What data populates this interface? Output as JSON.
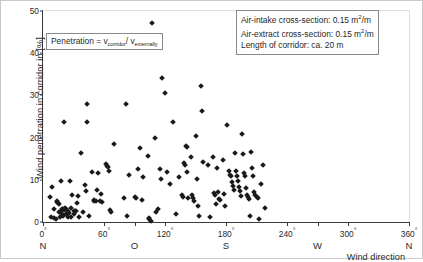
{
  "chart_data": {
    "type": "scatter",
    "title": "",
    "xlabel": "Wind direction",
    "ylabel": "Wind penetration in corridor in [%]",
    "xlim": [
      0,
      360
    ],
    "ylim": [
      0,
      50
    ],
    "grid": false,
    "legend": "none",
    "xticks": [
      {
        "value": 0,
        "label": "0",
        "degree": "°",
        "direction": "N"
      },
      {
        "value": 60,
        "label": "60",
        "degree": "°",
        "direction": ""
      },
      {
        "value": 90,
        "label": "",
        "degree": "",
        "direction": "O"
      },
      {
        "value": 120,
        "label": "120",
        "degree": "°",
        "direction": ""
      },
      {
        "value": 180,
        "label": "180",
        "degree": "°",
        "direction": "S"
      },
      {
        "value": 240,
        "label": "240",
        "degree": "°",
        "direction": ""
      },
      {
        "value": 270,
        "label": "",
        "degree": "",
        "direction": "W"
      },
      {
        "value": 300,
        "label": "300",
        "degree": "°",
        "direction": ""
      },
      {
        "value": 360,
        "label": "360",
        "degree": "°",
        "direction": "N"
      }
    ],
    "yticks": [
      0,
      10,
      20,
      30,
      40,
      50
    ],
    "marker": "diamond",
    "marker_color": "#1a1a1a",
    "points": [
      [
        6.5,
        6.0
      ],
      [
        8.0,
        1.2
      ],
      [
        9.0,
        8.2
      ],
      [
        10.5,
        1.0
      ],
      [
        11.0,
        3.0
      ],
      [
        12.5,
        0.8
      ],
      [
        13.5,
        4.8
      ],
      [
        14.0,
        5.0
      ],
      [
        14.5,
        4.5
      ],
      [
        15.5,
        2.3
      ],
      [
        16.0,
        4.3
      ],
      [
        16.5,
        1.3
      ],
      [
        17.5,
        2.6
      ],
      [
        18.0,
        9.7
      ],
      [
        18.5,
        3.0
      ],
      [
        19.0,
        2.0
      ],
      [
        19.5,
        3.1
      ],
      [
        20.0,
        1.5
      ],
      [
        20.5,
        2.8
      ],
      [
        21.0,
        23.7
      ],
      [
        22.0,
        3.4
      ],
      [
        22.5,
        2.0
      ],
      [
        23.0,
        3.0
      ],
      [
        23.5,
        1.8
      ],
      [
        24.5,
        2.5
      ],
      [
        25.0,
        1.1
      ],
      [
        26.0,
        2.2
      ],
      [
        26.5,
        9.7
      ],
      [
        27.5,
        3.2
      ],
      [
        28.0,
        1.2
      ],
      [
        29.0,
        6.3
      ],
      [
        30.0,
        2.5
      ],
      [
        30.5,
        1.8
      ],
      [
        31.5,
        2.6
      ],
      [
        32.0,
        2.5
      ],
      [
        33.0,
        4.5
      ],
      [
        34.0,
        6.2
      ],
      [
        35.0,
        1.2
      ],
      [
        37.0,
        16.3
      ],
      [
        39.0,
        2.4
      ],
      [
        41.0,
        8.8
      ],
      [
        42.0,
        7.3
      ],
      [
        43.0,
        28.0
      ],
      [
        43.5,
        23.7
      ],
      [
        45.0,
        1.4
      ],
      [
        48.0,
        11.9
      ],
      [
        50.0,
        5.2
      ],
      [
        50.5,
        5.0
      ],
      [
        52.0,
        4.9
      ],
      [
        53.0,
        7.5
      ],
      [
        54.0,
        11.7
      ],
      [
        56.0,
        5.0
      ],
      [
        57.0,
        6.7
      ],
      [
        58.0,
        4.8
      ],
      [
        62.0,
        13.8
      ],
      [
        63.0,
        13.3
      ],
      [
        64.0,
        13.0
      ],
      [
        64.5,
        12.2
      ],
      [
        66.0,
        2.9
      ],
      [
        66.5,
        2.4
      ],
      [
        70.0,
        18.5
      ],
      [
        80.0,
        5.6
      ],
      [
        82.0,
        28.0
      ],
      [
        83.0,
        1.5
      ],
      [
        85.0,
        11.2
      ],
      [
        90.0,
        6.0
      ],
      [
        91.0,
        5.8
      ],
      [
        93.0,
        12.6
      ],
      [
        95.0,
        17.5
      ],
      [
        97.0,
        5.3
      ],
      [
        98.0,
        10.7
      ],
      [
        103.0,
        15.7
      ],
      [
        104.0,
        0.9
      ],
      [
        104.5,
        0.6
      ],
      [
        106.0,
        0.2
      ],
      [
        107.0,
        47.2
      ],
      [
        110.0,
        20.0
      ],
      [
        111.0,
        2.4
      ],
      [
        113.0,
        3.0
      ],
      [
        115.0,
        12.5
      ],
      [
        116.0,
        10.2
      ],
      [
        117.0,
        34.1
      ],
      [
        120.0,
        30.5
      ],
      [
        122.0,
        11.9
      ],
      [
        125.0,
        8.9
      ],
      [
        128.0,
        23.7
      ],
      [
        131.0,
        1.8
      ],
      [
        134.0,
        10.7
      ],
      [
        137.0,
        6.5
      ],
      [
        138.0,
        6.0
      ],
      [
        139.0,
        14.0
      ],
      [
        140.0,
        13.5
      ],
      [
        141.0,
        18.0
      ],
      [
        141.5,
        17.8
      ],
      [
        142.0,
        11.9
      ],
      [
        143.0,
        5.8
      ],
      [
        146.0,
        15.3
      ],
      [
        147.0,
        6.3
      ],
      [
        148.0,
        5.8
      ],
      [
        149.0,
        4.9
      ],
      [
        150.0,
        20.3
      ],
      [
        151.0,
        10.2
      ],
      [
        152.0,
        3.7
      ],
      [
        153.0,
        1.4
      ],
      [
        155.0,
        32.2
      ],
      [
        156.0,
        26.4
      ],
      [
        157.0,
        14.1
      ],
      [
        162.0,
        13.6
      ],
      [
        164.0,
        1.1
      ],
      [
        167.0,
        15.4
      ],
      [
        168.0,
        6.9
      ],
      [
        169.0,
        6.5
      ],
      [
        170.0,
        4.3
      ],
      [
        171.0,
        12.9
      ],
      [
        172.0,
        7.0
      ],
      [
        173.0,
        5.5
      ],
      [
        174.0,
        5.2
      ],
      [
        177.0,
        14.6
      ],
      [
        178.0,
        6.7
      ],
      [
        179.0,
        3.9
      ],
      [
        181.0,
        23.0
      ],
      [
        183.0,
        12.0
      ],
      [
        184.0,
        11.2
      ],
      [
        185.0,
        10.9
      ],
      [
        186.0,
        9.4
      ],
      [
        187.0,
        8.6
      ],
      [
        188.0,
        7.7
      ],
      [
        189.0,
        16.3
      ],
      [
        190.0,
        12.2
      ],
      [
        191.0,
        11.0
      ],
      [
        192.0,
        9.6
      ],
      [
        193.0,
        8.4
      ],
      [
        194.0,
        7.4
      ],
      [
        195.0,
        6.2
      ],
      [
        196.0,
        20.8
      ],
      [
        197.0,
        16.1
      ],
      [
        198.0,
        11.5
      ],
      [
        199.0,
        10.8
      ],
      [
        200.0,
        8.0
      ],
      [
        201.0,
        6.5
      ],
      [
        202.0,
        6.0
      ],
      [
        203.0,
        5.4
      ],
      [
        204.0,
        1.5
      ],
      [
        205.0,
        16.6
      ],
      [
        206.0,
        12.9
      ],
      [
        207.0,
        11.0
      ],
      [
        208.0,
        7.0
      ],
      [
        209.0,
        6.4
      ],
      [
        210.0,
        6.0
      ],
      [
        211.0,
        5.6
      ],
      [
        212.0,
        0.7
      ],
      [
        214.0,
        8.9
      ],
      [
        216.0,
        13.4
      ],
      [
        218.0,
        3.3
      ]
    ]
  },
  "annotations": {
    "formula": {
      "prefix": "Penetration = v",
      "sub1": "corridor",
      "divider": "/ v",
      "sub2": "externally"
    },
    "info": {
      "line1_label": "Air-intake cross-section:",
      "line1_value": "0.15 m",
      "line1_sup": "2",
      "line1_unit": "/m",
      "line2_label": "Air-extract cross-section:",
      "line2_value": "0.15 m",
      "line2_sup": "2",
      "line2_unit": "/m",
      "line3_label": "Length of corridor:",
      "line3_value": "ca. 20 m"
    }
  }
}
